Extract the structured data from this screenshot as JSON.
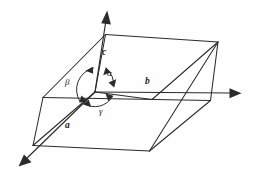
{
  "figure": {
    "background_color": "#fefefe",
    "line_color": "#2b2b2b",
    "width": 257,
    "height": 177
  },
  "axes": [
    {
      "id": "axis-a",
      "label": "a",
      "label_x": 68,
      "label_y": 127,
      "direction": "down-left",
      "line": "M95 92 L24 161",
      "arrow_points": "24,161 33,152 28,152 29,147 21.5,158.5"
    },
    {
      "id": "axis-b",
      "label": "b",
      "label_x": 146,
      "label_y": 83,
      "direction": "right",
      "line": "M95 92 L233 93",
      "arrow_points": "241,93 230,88.5 230,97.5"
    },
    {
      "id": "axis-c",
      "label": "c",
      "label_x": 102,
      "label_y": 55,
      "direction": "up",
      "line": "M95 92 L106 19",
      "arrow_points": "107,11 101.5,22.5 110.5,23.5"
    }
  ],
  "angles": [
    {
      "id": "angle-alpha",
      "label": "α",
      "label_x": 109,
      "label_y": 75,
      "between": [
        "b",
        "c"
      ],
      "arc": "M108.5 70.5 A 18 18 0 0 1 112.5 86.5",
      "head_start": "108.5,70.5 104.6,77.3 112.1,76.1",
      "head_end": "112.5,86.5 116.6,80.1 108.9,81.2"
    },
    {
      "id": "angle-beta",
      "label": "β",
      "label_x": 68,
      "label_y": 83,
      "between": [
        "a",
        "c"
      ],
      "arc": "M94 69.5 A 18 18 0 0 0 81.5 101.5",
      "head_start": "94,69.5 86.7,72.3 93.3,76.2",
      "head_end": "81.5,101.5 89,100.2 83.2,95.2"
    },
    {
      "id": "angle-gamma",
      "label": "γ",
      "label_x": 101,
      "label_y": 112,
      "between": [
        "a",
        "b"
      ],
      "arc": "M85.5 104 A 18 18 0 0 0 111.5 97",
      "head_start": "85.5,104 92.8,106.4 90.5,99.5",
      "head_end": "111.5,97 104.3,94.5 106.6,101.4"
    }
  ],
  "cell": {
    "vertices": {
      "origin": [
        95,
        92
      ],
      "top_back_left": [
        105,
        35
      ],
      "top_back_right": [
        218,
        42
      ],
      "top_front_right": [
        152,
        99
      ],
      "bottom_front_left": [
        33,
        145
      ],
      "bottom_front_right": [
        149,
        151
      ],
      "bottom_back_right": [
        210,
        100
      ],
      "bottom_back_left": [
        43,
        97
      ]
    },
    "edges": [
      {
        "name": "top-face-back-left-edge",
        "path": "M95 92 L105 35"
      },
      {
        "name": "top-face-back-edge",
        "path": "M105 35 L218 42"
      },
      {
        "name": "top-face-right-edge",
        "path": "M218 42 L152 99"
      },
      {
        "name": "top-face-front-edge",
        "path": "M152 99 L95 92"
      },
      {
        "name": "vertical-edge-front-left",
        "path": "M43 97 L33 145"
      },
      {
        "name": "vertical-edge-front-right",
        "path": "M210 100 L149 151"
      },
      {
        "name": "bottom-face-left-edge",
        "path": "M33 145 L43 97"
      },
      {
        "name": "bottom-face-front-edge",
        "path": "M33 145 L149 151"
      },
      {
        "name": "bottom-face-back-edge",
        "path": "M43 97 L210 100"
      },
      {
        "name": "diagonal-edge-a-direction",
        "path": "M43 97 L33 145"
      },
      {
        "name": "left-slant-upper",
        "path": "M43 97 L105 35"
      },
      {
        "name": "right-slant-lower",
        "path": "M218 42 L210 100"
      },
      {
        "name": "bottom-right-slant",
        "path": "M149 151 L218 42"
      },
      {
        "name": "bottom-left-slant",
        "path": "M33 145 L95 92"
      }
    ]
  }
}
